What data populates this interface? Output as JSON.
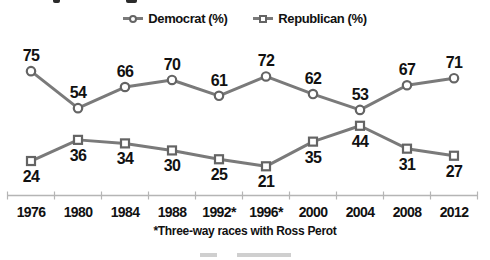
{
  "chart_data": {
    "type": "line",
    "categories": [
      "1976",
      "1980",
      "1984",
      "1988",
      "1992*",
      "1996*",
      "2000",
      "2004",
      "2008",
      "2012"
    ],
    "series": [
      {
        "name": "Democrat (%)",
        "marker": "circle",
        "values": [
          75,
          54,
          66,
          70,
          61,
          72,
          62,
          53,
          67,
          71
        ]
      },
      {
        "name": "Republican (%)",
        "marker": "square",
        "values": [
          24,
          36,
          34,
          30,
          25,
          21,
          35,
          44,
          31,
          27
        ]
      }
    ],
    "data_labels": true,
    "legend_position": "top",
    "xlabel": "",
    "ylabel": "",
    "y_axis_hidden": true,
    "footnote": "*Three-way races with Ross Perot",
    "colors": {
      "series_line": "#7a7a7a",
      "marker_stroke": "#646464",
      "marker_fill": "#ffffff",
      "data_label": "#111111",
      "axis": "#b5b5b5"
    }
  }
}
